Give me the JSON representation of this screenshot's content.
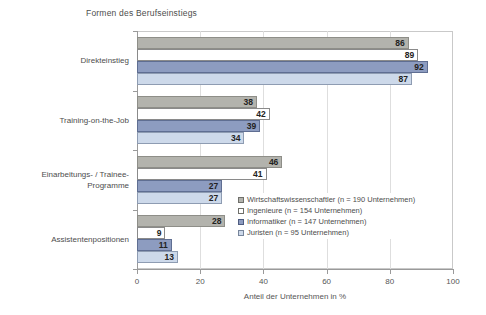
{
  "chart_data": {
    "type": "bar",
    "orientation": "horizontal",
    "title": "Formen des Berufseinstiegs",
    "xlabel": "Anteil der Unternehmen in %",
    "ylabel": "",
    "xlim": [
      0,
      100
    ],
    "xticks": [
      0,
      20,
      40,
      60,
      80,
      100
    ],
    "grid": true,
    "legend_position": "inside-center-right",
    "categories": [
      "Direkteinstieg",
      "Training-on-the-Job",
      "Einarbeitungs- / Trainee-\nProgramme",
      "Assistentenpositionen"
    ],
    "series": [
      {
        "name": "Wirtschaftswissenschaftler (n = 190 Unternehmen)",
        "color": "#b3b3ad",
        "values": [
          86,
          38,
          46,
          28
        ]
      },
      {
        "name": "Ingenieure (n = 154 Unternehmen)",
        "color": "#ffffff",
        "values": [
          89,
          42,
          41,
          9
        ]
      },
      {
        "name": "Informatiker (n = 147 Unternehmen)",
        "color": "#8d9cc0",
        "values": [
          92,
          39,
          27,
          11
        ]
      },
      {
        "name": "Juristen (n = 95 Unternehmen)",
        "color": "#cdd9ea",
        "values": [
          87,
          34,
          27,
          13
        ]
      }
    ]
  },
  "axis": {
    "tick_labels": [
      "0",
      "20",
      "40",
      "60",
      "80",
      "100"
    ],
    "title": "Anteil der Unternehmen in %"
  },
  "legend": {
    "items": [
      {
        "label": "Wirtschaftswissenschaftler (n = 190 Unternehmen)"
      },
      {
        "label": "Ingenieure (n = 154 Unternehmen)"
      },
      {
        "label": "Informatiker (n = 147 Unternehmen)"
      },
      {
        "label": "Juristen (n = 95 Unternehmen)"
      }
    ]
  }
}
